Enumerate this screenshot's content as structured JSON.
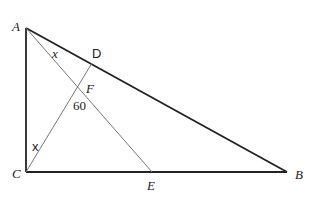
{
  "diagram": {
    "points": {
      "A": {
        "label": "A",
        "x": 26,
        "y": 28
      },
      "B": {
        "label": "B",
        "x": 287,
        "y": 172
      },
      "C": {
        "label": "C",
        "x": 26,
        "y": 172
      },
      "D": {
        "label": "D",
        "x": 92,
        "y": 63
      },
      "E": {
        "label": "E",
        "x": 152,
        "y": 172
      },
      "F": {
        "label": "F",
        "x": 78,
        "y": 88
      }
    },
    "angle_labels": {
      "at_A": "x",
      "at_C": "x",
      "at_F": "60"
    },
    "colors": {
      "triangle": "#222222",
      "inner_lines": "#777777",
      "background": "#ffffff"
    }
  }
}
